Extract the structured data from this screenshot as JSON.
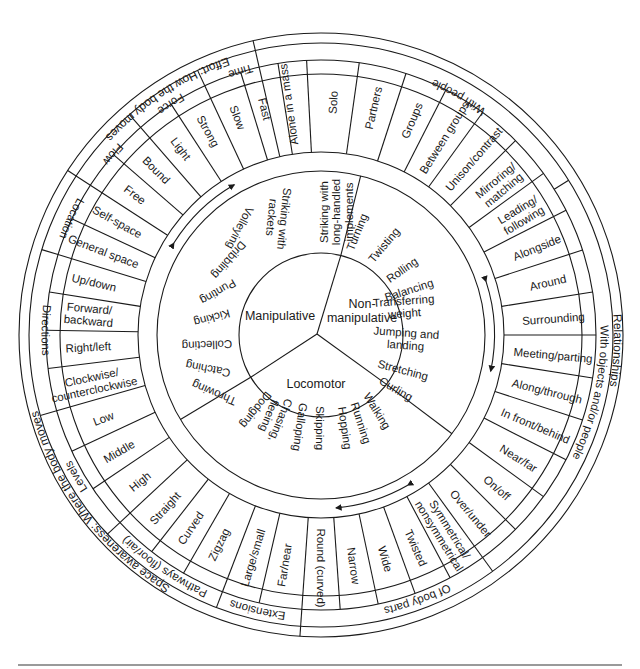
{
  "geometry": {
    "cx": 321,
    "cy": 335,
    "r_outer": 302,
    "r_ring2": 292,
    "r_ring3": 275,
    "r_items_outer": 261,
    "r_band_outer": 183,
    "r_band_inner": 164,
    "r_core": 82
  },
  "core": {
    "sectors": [
      {
        "label": "Manipulative",
        "lines": [
          "Manipulative"
        ],
        "x": 280,
        "y": 316
      },
      {
        "label": "Non-manipulative",
        "lines": [
          "Non-",
          "manipulative"
        ],
        "x": 362,
        "y": 311
      },
      {
        "label": "Locomotor",
        "lines": [
          "Locomotor"
        ],
        "x": 316,
        "y": 384
      }
    ],
    "dividers_deg": [
      -76,
      37,
      149
    ]
  },
  "skills": {
    "manipulative": [
      "Striking with long-handled implements",
      "Striking with rackets",
      "Volleying",
      "Dribbling",
      "Punting",
      "Kicking",
      "Collecting",
      "Catching",
      "Throwing"
    ],
    "non_manipulative": [
      "Turning",
      "Twisting",
      "Rolling",
      "Balancing",
      "Transferring weight",
      "Jumping and landing",
      "Stretching",
      "Curling"
    ],
    "locomotor": [
      "Walking",
      "Running",
      "Hopping",
      "Skipping",
      "Galloping",
      "Chasing, fleeing",
      "Dodging"
    ]
  },
  "skill_labels": [
    {
      "lines": [
        "Striking with",
        "long-handled",
        "implements"
      ],
      "x": 336,
      "y": 212,
      "rot": -90
    },
    {
      "lines": [
        "Striking with",
        "rackets"
      ],
      "x": 278,
      "y": 218,
      "rot": 96
    },
    {
      "lines": [
        "Volleying"
      ],
      "x": 240,
      "y": 228,
      "rot": 117
    },
    {
      "lines": [
        "Dribbling"
      ],
      "x": 229,
      "y": 260,
      "rot": 131
    },
    {
      "lines": [
        "Punting"
      ],
      "x": 218,
      "y": 292,
      "rot": 150
    },
    {
      "lines": [
        "Kicking"
      ],
      "x": 212,
      "y": 318,
      "rot": 165
    },
    {
      "lines": [
        "Collecting"
      ],
      "x": 207,
      "y": 345,
      "rot": 178
    },
    {
      "lines": [
        "Catching"
      ],
      "x": 208,
      "y": 369,
      "rot": 191
    },
    {
      "lines": [
        "Throwing"
      ],
      "x": 214,
      "y": 393,
      "rot": 203
    },
    {
      "lines": [
        "Turning"
      ],
      "x": 357,
      "y": 232,
      "rot": -68
    },
    {
      "lines": [
        "Twisting"
      ],
      "x": 384,
      "y": 245,
      "rot": -50
    },
    {
      "lines": [
        "Rolling"
      ],
      "x": 402,
      "y": 270,
      "rot": -35
    },
    {
      "lines": [
        "Balancing"
      ],
      "x": 409,
      "y": 290,
      "rot": -18
    },
    {
      "lines": [
        "Transferring",
        "weight"
      ],
      "x": 404,
      "y": 307,
      "rot": -4
    },
    {
      "lines": [
        "Jumping and",
        "landing"
      ],
      "x": 406,
      "y": 339,
      "rot": 4
    },
    {
      "lines": [
        "Stretching"
      ],
      "x": 403,
      "y": 370,
      "rot": 15
    },
    {
      "lines": [
        "Curling"
      ],
      "x": 396,
      "y": 389,
      "rot": 30
    },
    {
      "lines": [
        "Walking"
      ],
      "x": 377,
      "y": 411,
      "rot": 58
    },
    {
      "lines": [
        "Running"
      ],
      "x": 361,
      "y": 423,
      "rot": 72
    },
    {
      "lines": [
        "Hopping"
      ],
      "x": 345,
      "y": 428,
      "rot": 82
    },
    {
      "lines": [
        "Skipping"
      ],
      "x": 320,
      "y": 428,
      "rot": 90
    },
    {
      "lines": [
        "Galloping"
      ],
      "x": 300,
      "y": 427,
      "rot": 98
    },
    {
      "lines": [
        "Chasing,",
        "fleeing"
      ],
      "x": 275,
      "y": 418,
      "rot": 112
    },
    {
      "lines": [
        "Dodging"
      ],
      "x": 256,
      "y": 410,
      "rot": 128
    }
  ],
  "concepts": {
    "effort": {
      "title": "Effort: How the body moves",
      "groups": [
        {
          "name": "Time",
          "items": [
            "Fast",
            "Slow"
          ]
        },
        {
          "name": "Force",
          "items": [
            "Strong",
            "Light"
          ]
        },
        {
          "name": "Flow",
          "items": [
            "Bound",
            "Free"
          ]
        }
      ]
    },
    "space_awareness": {
      "title": "Space awareness: Where the body moves",
      "groups": [
        {
          "name": "Location",
          "items": [
            "Self-space",
            "General space"
          ]
        },
        {
          "name": "Directions",
          "items": [
            "Up/down",
            "Forward/ backward",
            "Right/left",
            "Clockwise/ counterclockwise"
          ]
        },
        {
          "name": "Levels",
          "items": [
            "Low",
            "Middle",
            "High"
          ]
        },
        {
          "name": "Pathways (floor/air)",
          "items": [
            "Straight",
            "Curved",
            "Zigzag"
          ]
        },
        {
          "name": "Extensions",
          "items": [
            "Large/small",
            "Far/near"
          ]
        }
      ]
    },
    "relationships": {
      "title": "Relationships",
      "groups": [
        {
          "name": "Of body parts",
          "items": [
            "Round (curved)",
            "Narrow",
            "Wide",
            "Twisted",
            "Symmetrical/ nonsymmetrical"
          ]
        },
        {
          "name": "With objects and/or people",
          "items": [
            "Over/under",
            "On/off",
            "Near/far",
            "In front/behind",
            "Along/through",
            "Meeting/parting",
            "Surrounding",
            "Around",
            "Alongside"
          ]
        },
        {
          "name": "With people",
          "items": [
            "Leading/ following",
            "Mirroring/ matching",
            "Unison/contrast",
            "Between groups",
            "Groups",
            "Partners",
            "Solo",
            "Alone in a mass"
          ]
        }
      ]
    }
  },
  "ring_items": [
    {
      "lines": [
        "Alone in a mass"
      ],
      "deg": -98
    },
    {
      "lines": [
        "Solo"
      ],
      "deg": -87
    },
    {
      "lines": [
        "Partners"
      ],
      "deg": -77
    },
    {
      "lines": [
        "Groups"
      ],
      "deg": -67
    },
    {
      "lines": [
        "Between groups"
      ],
      "deg": -58
    },
    {
      "lines": [
        "Unison/contrast"
      ],
      "deg": -49
    },
    {
      "lines": [
        "Mirroring/",
        "matching"
      ],
      "deg": -40
    },
    {
      "lines": [
        "Leading/",
        "following"
      ],
      "deg": -31
    },
    {
      "lines": [
        "Alongside"
      ],
      "deg": -22
    },
    {
      "lines": [
        "Around"
      ],
      "deg": -13
    },
    {
      "lines": [
        "Surrounding"
      ],
      "deg": -4
    },
    {
      "lines": [
        "Meeting/parting"
      ],
      "deg": 5
    },
    {
      "lines": [
        "Along/through"
      ],
      "deg": 14
    },
    {
      "lines": [
        "In front/behind"
      ],
      "deg": 23
    },
    {
      "lines": [
        "Near/far"
      ],
      "deg": 32
    },
    {
      "lines": [
        "On/off"
      ],
      "deg": 41
    },
    {
      "lines": [
        "Over/under"
      ],
      "deg": 50
    },
    {
      "lines": [
        "Symmetrical/",
        "nonsymmetrical"
      ],
      "deg": 58
    },
    {
      "lines": [
        "Twisted"
      ],
      "deg": 66
    },
    {
      "lines": [
        "Wide"
      ],
      "deg": 74
    },
    {
      "lines": [
        "Narrow"
      ],
      "deg": 82
    },
    {
      "lines": [
        "Round (curved)"
      ],
      "deg": 90
    },
    {
      "lines": [
        "Far/near"
      ],
      "deg": 99
    },
    {
      "lines": [
        "Large/small"
      ],
      "deg": 107
    },
    {
      "lines": [
        "Zigzag"
      ],
      "deg": 116
    },
    {
      "lines": [
        "Curved"
      ],
      "deg": 124
    },
    {
      "lines": [
        "Straight"
      ],
      "deg": 132
    },
    {
      "lines": [
        "High"
      ],
      "deg": 141
    },
    {
      "lines": [
        "Middle"
      ],
      "deg": 150
    },
    {
      "lines": [
        "Low"
      ],
      "deg": 159
    },
    {
      "lines": [
        "Clockwise/",
        "counterclockwise"
      ],
      "deg": 168
    },
    {
      "lines": [
        "Right/left"
      ],
      "deg": 177
    },
    {
      "lines": [
        "Forward/",
        "backward"
      ],
      "deg": 185
    },
    {
      "lines": [
        "Up/down"
      ],
      "deg": 193
    },
    {
      "lines": [
        "General space"
      ],
      "deg": 201
    },
    {
      "lines": [
        "Self-space"
      ],
      "deg": 209
    },
    {
      "lines": [
        "Free"
      ],
      "deg": 217
    },
    {
      "lines": [
        "Bound"
      ],
      "deg": 225
    },
    {
      "lines": [
        "Light"
      ],
      "deg": 233
    },
    {
      "lines": [
        "Strong"
      ],
      "deg": 241
    },
    {
      "lines": [
        "Slow"
      ],
      "deg": 249
    },
    {
      "lines": [
        "Fast"
      ],
      "deg": 256
    }
  ],
  "ring_dividers_deg": [
    -103,
    -93,
    -82,
    -72,
    -63,
    -54,
    -45,
    -36,
    -27,
    -18,
    -9,
    0,
    9,
    18,
    27,
    36,
    45,
    54,
    62,
    70,
    78,
    86,
    94,
    103,
    111,
    120,
    128,
    137,
    146,
    155,
    164,
    173,
    181,
    189,
    197,
    205,
    213,
    221,
    229,
    237,
    245,
    253,
    261
  ],
  "group_labels": [
    {
      "text": "With people",
      "deg": -60,
      "band": "g"
    },
    {
      "text": "With objects and/or people",
      "deg": 12,
      "band": "g"
    },
    {
      "text": "Of body parts",
      "deg": 70,
      "band": "g"
    },
    {
      "text": "Extensions",
      "deg": 103,
      "band": "g"
    },
    {
      "text": "Pathways (floor/air)",
      "deg": 124,
      "band": "g"
    },
    {
      "text": "Levels",
      "deg": 150,
      "band": "g"
    },
    {
      "text": "Directions",
      "deg": 181,
      "band": "g"
    },
    {
      "text": "Location",
      "deg": 205,
      "band": "g"
    },
    {
      "text": "Flow",
      "deg": 221,
      "band": "g"
    },
    {
      "text": "Force",
      "deg": 237,
      "band": "g"
    },
    {
      "text": "Time",
      "deg": 253,
      "band": "g"
    }
  ],
  "group_dividers_deg": [
    -103,
    -32,
    54,
    94,
    111,
    137,
    164,
    197,
    213,
    229,
    245
  ],
  "outer_labels": [
    {
      "text": "Effort: How the body moves",
      "deg": 237
    },
    {
      "text": "Space awareness: Where the body moves",
      "deg": 143
    },
    {
      "text": "Relationships",
      "deg": 3
    }
  ],
  "outer_dividers_deg": [
    -103,
    94,
    213
  ],
  "arrows": [
    {
      "name": "effort-to-manipulative-arrow",
      "deg_from": 212,
      "deg_to": 240
    },
    {
      "name": "relationships-to-nonmanip-arrow",
      "deg_from": -18,
      "deg_to": 12
    },
    {
      "name": "body-parts-to-locomotor-arrow",
      "deg_from": 60,
      "deg_to": 85
    }
  ]
}
